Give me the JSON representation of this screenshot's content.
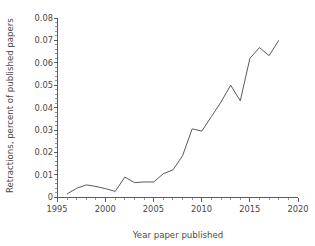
{
  "chart_data": {
    "type": "line",
    "title": "",
    "xlabel": "Year paper published",
    "ylabel": "Retractions, percent of published papers",
    "xlim": [
      1995,
      2020
    ],
    "ylim": [
      0,
      0.08
    ],
    "grid": false,
    "legend": null,
    "x_ticks": [
      1995,
      2000,
      2005,
      2010,
      2015,
      2020
    ],
    "x_tick_labels": [
      "1995",
      "2000",
      "2005",
      "2010",
      "2015",
      "2020"
    ],
    "x_minor_tick_interval": 1,
    "y_ticks": [
      0,
      0.01,
      0.02,
      0.03,
      0.04,
      0.05,
      0.06,
      0.07,
      0.08
    ],
    "y_tick_labels": [
      "0",
      "0.01",
      "0.02",
      "0.03",
      "0.04",
      "0.05",
      "0.06",
      "0.07",
      "0.08"
    ],
    "y_minor_tick_interval": 0.002,
    "line_color": "#5a5a5a",
    "x": [
      1996,
      1997,
      1998,
      1999,
      2000,
      2001,
      2002,
      2003,
      2004,
      2005,
      2006,
      2007,
      2008,
      2009,
      2010,
      2011,
      2012,
      2013,
      2014,
      2015,
      2016,
      2017,
      2018
    ],
    "values": [
      0.0015,
      0.004,
      0.0055,
      0.0048,
      0.0038,
      0.0026,
      0.009,
      0.0065,
      0.0068,
      0.0068,
      0.0105,
      0.0122,
      0.0185,
      0.0305,
      0.0295,
      0.036,
      0.0425,
      0.05,
      0.043,
      0.062,
      0.0668,
      0.0632,
      0.07
    ],
    "series": [
      {
        "name": "Retractions",
        "values": [
          0.0015,
          0.004,
          0.0055,
          0.0048,
          0.0038,
          0.0026,
          0.009,
          0.0065,
          0.0068,
          0.0068,
          0.0105,
          0.0122,
          0.0185,
          0.0305,
          0.0295,
          0.036,
          0.0425,
          0.05,
          0.043,
          0.062,
          0.0668,
          0.0632,
          0.07
        ]
      }
    ]
  }
}
